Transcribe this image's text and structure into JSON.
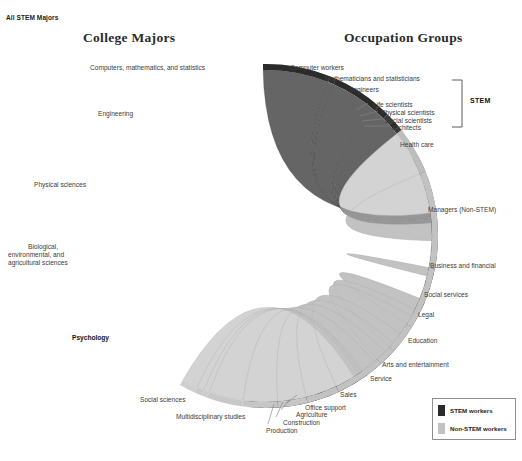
{
  "header": {
    "corner_tag": "All STEM Majors",
    "title_left": "College Majors",
    "title_right": "Occupation Groups"
  },
  "bracket": {
    "label": "STEM"
  },
  "legend": {
    "items": [
      {
        "label": "STEM workers",
        "color": "#2b2b2b"
      },
      {
        "label": "Non-STEM workers",
        "color": "#c2c2c2"
      }
    ]
  },
  "chart_data": {
    "type": "chord",
    "title": "All STEM Majors",
    "left_axis_title": "College Majors",
    "right_axis_title": "Occupation Groups",
    "highlighted_source": "Psychology",
    "legend_position": "bottom-right",
    "colors": {
      "stem_dark": "#2b2b2b",
      "stem_mid": "#6e6e6e",
      "non_stem_light": "#c2c2c2",
      "ribbon_light": "#b8b8b8",
      "ribbon_dark": "#4a4a4a",
      "text": "#3b3b3b"
    },
    "sources": [
      {
        "name": "Computers, mathematics, and statistics",
        "share": 9.0,
        "color": "#8f8f8f",
        "a0": 269,
        "a1": 291
      },
      {
        "name": "Engineering",
        "share": 17.0,
        "color": "#dcdcdc",
        "a0": 291,
        "a1": 332
      },
      {
        "name": "Physical sciences",
        "share": 7.0,
        "color": "#6e6e6e",
        "a0": 332,
        "a1": 349
      },
      {
        "name": "Biological, environmental, and agricultural  sciences",
        "share": 16.0,
        "color": "#2f2f2f",
        "a0": 349,
        "a1": 388
      },
      {
        "name": "Psychology",
        "share": 10.5,
        "color": "#5a5a5a",
        "a0": 388,
        "a1": 414
      },
      {
        "name": "Social sciences",
        "share": 16.0,
        "color": "#222222",
        "a0": 414,
        "a1": 452
      },
      {
        "name": "Multidisciplinary studies",
        "share": 1.5,
        "color": "#6a6a6a",
        "a0": 452,
        "a1": 456
      }
    ],
    "targets": [
      {
        "name": "Computer workers",
        "group": "STEM",
        "share": 9.5,
        "color": "#2b2b2b",
        "a0": 269,
        "a1": 292
      },
      {
        "name": "Mathematicians and statisticians",
        "group": "STEM",
        "share": 0.7,
        "color": "#2b2b2b",
        "a0": 292,
        "a1": 294
      },
      {
        "name": "Engineers",
        "group": "STEM",
        "share": 7.0,
        "color": "#2b2b2b",
        "a0": 294,
        "a1": 311
      },
      {
        "name": "Life scientists",
        "group": "STEM",
        "share": 1.6,
        "color": "#2b2b2b",
        "a0": 311,
        "a1": 315
      },
      {
        "name": "Physical scientists",
        "group": "STEM",
        "share": 1.2,
        "color": "#3a3a3a",
        "a0": 315,
        "a1": 318
      },
      {
        "name": "Social scientists",
        "group": "STEM",
        "share": 1.0,
        "color": "#2b2b2b",
        "a0": 318,
        "a1": 320.5
      },
      {
        "name": "Architects",
        "group": "STEM",
        "share": 0.6,
        "color": "#3a3a3a",
        "a0": 320.5,
        "a1": 322
      },
      {
        "name": "Health care",
        "group": "Non-STEM",
        "share": 6.5,
        "color": "#bdbdbd",
        "a0": 322,
        "a1": 338
      },
      {
        "name": "Managers (Non-STEM)",
        "group": "Non-STEM",
        "share": 13.5,
        "color": "#c2c2c2",
        "a0": 338,
        "a1": 371
      },
      {
        "name": "Business and financial",
        "group": "Non-STEM",
        "share": 8.5,
        "color": "#c2c2c2",
        "a0": 371,
        "a1": 392
      },
      {
        "name": "Social services",
        "group": "Non-STEM",
        "share": 4.0,
        "color": "#c2c2c2",
        "a0": 392,
        "a1": 402
      },
      {
        "name": "Legal",
        "group": "Non-STEM",
        "share": 2.5,
        "color": "#c2c2c2",
        "a0": 402,
        "a1": 408
      },
      {
        "name": "Education",
        "group": "Non-STEM",
        "share": 7.0,
        "color": "#c2c2c2",
        "a0": 408,
        "a1": 425
      },
      {
        "name": "Arts and entertainment",
        "group": "Non-STEM",
        "share": 4.5,
        "color": "#c2c2c2",
        "a0": 425,
        "a1": 436
      },
      {
        "name": "Service",
        "group": "Non-STEM",
        "share": 4.0,
        "color": "#c6c6c6",
        "a0": 436,
        "a1": 446
      },
      {
        "name": "Sales",
        "group": "Non-STEM",
        "share": 5.0,
        "color": "#c6c6c6",
        "a0": 446,
        "a1": 458
      },
      {
        "name": "Office support",
        "group": "Non-STEM",
        "share": 5.0,
        "color": "#c8c8c8",
        "a0": 458,
        "a1": 470
      },
      {
        "name": "Agriculture",
        "group": "Non-STEM",
        "share": 0.8,
        "color": "#cccccc",
        "a0": 470,
        "a1": 472
      },
      {
        "name": "Construction",
        "group": "Non-STEM",
        "share": 1.0,
        "color": "#c9c9c9",
        "a0": 472,
        "a1": 474.5
      },
      {
        "name": "Production",
        "group": "Non-STEM",
        "share": 2.2,
        "color": "#cfcfcf",
        "a0": 474.5,
        "a1": 480
      }
    ],
    "flows_from_psychology": [
      {
        "to": "Computer workers",
        "value": 1.0
      },
      {
        "to": "Mathematicians and statisticians",
        "value": 0.2
      },
      {
        "to": "Engineers",
        "value": 0.3
      },
      {
        "to": "Life scientists",
        "value": 0.4
      },
      {
        "to": "Physical scientists",
        "value": 0.3
      },
      {
        "to": "Social scientists",
        "value": 1.0
      },
      {
        "to": "Architects",
        "value": 0.2
      },
      {
        "to": "Health care",
        "value": 6.0
      },
      {
        "to": "Managers (Non-STEM)",
        "value": 12.0
      },
      {
        "to": "Business and financial",
        "value": 8.0
      },
      {
        "to": "Social services",
        "value": 4.0
      },
      {
        "to": "Legal",
        "value": 2.5
      },
      {
        "to": "Education",
        "value": 7.0
      },
      {
        "to": "Arts and entertainment",
        "value": 4.0
      },
      {
        "to": "Service",
        "value": 4.0
      },
      {
        "to": "Sales",
        "value": 5.0
      },
      {
        "to": "Office support",
        "value": 5.0
      },
      {
        "to": "Agriculture",
        "value": 0.6
      },
      {
        "to": "Construction",
        "value": 0.9
      },
      {
        "to": "Production",
        "value": 2.0
      }
    ]
  },
  "left_labels": [
    {
      "text": "Computers, mathematics, and statistics",
      "x": 90,
      "y": 64,
      "align": "left"
    },
    {
      "text": "Engineering",
      "x": 98,
      "y": 110,
      "align": "left"
    },
    {
      "text": "Physical sciences",
      "x": 34,
      "y": 181,
      "align": "left"
    },
    {
      "text": "Biological,",
      "x": 28,
      "y": 243,
      "align": "left"
    },
    {
      "text": "environmental, and",
      "x": 8,
      "y": 251,
      "align": "left"
    },
    {
      "text": "agricultural  sciences",
      "x": 8,
      "y": 259,
      "align": "left"
    },
    {
      "text": "Psychology",
      "x": 72,
      "y": 334,
      "align": "left",
      "bold": true
    },
    {
      "text": "Social sciences",
      "x": 140,
      "y": 396,
      "align": "left"
    },
    {
      "text": "Multidisciplinary studies",
      "x": 176,
      "y": 413,
      "align": "left"
    }
  ],
  "right_labels": [
    {
      "text": "Computer workers",
      "x": 290,
      "y": 64
    },
    {
      "text": "Mathematicians and statisticians",
      "x": 325,
      "y": 75
    },
    {
      "text": "Engineers",
      "x": 349,
      "y": 86
    },
    {
      "text": "Life scientists",
      "x": 373,
      "y": 101
    },
    {
      "text": "Physical scientists",
      "x": 381,
      "y": 109
    },
    {
      "text": "Social scientists",
      "x": 385,
      "y": 117
    },
    {
      "text": "Architects",
      "x": 392,
      "y": 124
    },
    {
      "text": "Health care",
      "x": 400,
      "y": 141
    },
    {
      "text": "Managers (Non-STEM)",
      "x": 428,
      "y": 206
    },
    {
      "text": "Business and financial",
      "x": 430,
      "y": 262
    },
    {
      "text": "Social services",
      "x": 424,
      "y": 291
    },
    {
      "text": "Legal",
      "x": 418,
      "y": 311
    },
    {
      "text": "Education",
      "x": 408,
      "y": 337
    },
    {
      "text": "Arts and entertainment",
      "x": 382,
      "y": 361
    },
    {
      "text": "Service",
      "x": 370,
      "y": 375
    },
    {
      "text": "Sales",
      "x": 340,
      "y": 391
    },
    {
      "text": "Office support",
      "x": 305,
      "y": 404
    },
    {
      "text": "Agriculture",
      "x": 296,
      "y": 411
    },
    {
      "text": "Construction",
      "x": 283,
      "y": 419
    },
    {
      "text": "Production",
      "x": 266,
      "y": 427
    }
  ]
}
